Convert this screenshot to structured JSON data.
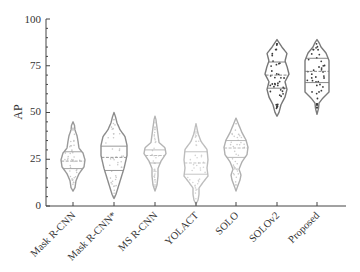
{
  "chart_data": {
    "type": "violin",
    "title": "",
    "xlabel": "",
    "ylabel": "AP",
    "ylim": [
      0,
      100
    ],
    "yticks": [
      0,
      25,
      50,
      75,
      100
    ],
    "grid": false,
    "legend": null,
    "categories": [
      "Mask R-CNN",
      "Mask R-CNN*",
      "MS R-CNN",
      "YOLACT",
      "SOLO",
      "SOLOv2",
      "Proposed"
    ],
    "series": [
      {
        "name": "Mask R-CNN",
        "min": 8,
        "max": 45,
        "q1": 20,
        "median": 24,
        "q3": 29,
        "color": "#9a9a9a",
        "dot_color": "#c8c8c8"
      },
      {
        "name": "Mask R-CNN*",
        "min": 4,
        "max": 50,
        "q1": 19,
        "median": 26,
        "q3": 32,
        "color": "#8c8c8c",
        "dot_color": "#c8c8c8"
      },
      {
        "name": "MS R-CNN",
        "min": 8,
        "max": 48,
        "q1": 23,
        "median": 27,
        "q3": 30,
        "color": "#b4b4b4",
        "dot_color": "#d0d0d0"
      },
      {
        "name": "YOLACT",
        "min": 1,
        "max": 44,
        "q1": 17,
        "median": 23,
        "q3": 29,
        "color": "#bdbdbd",
        "dot_color": "#d4d4d4"
      },
      {
        "name": "SOLO",
        "min": 8,
        "max": 47,
        "q1": 26,
        "median": 31,
        "q3": 35,
        "color": "#b0b0b0",
        "dot_color": "#cccccc"
      },
      {
        "name": "SOLOv2",
        "min": 48,
        "max": 89,
        "q1": 63,
        "median": 70,
        "q3": 77,
        "color": "#777777",
        "dot_color": "#3a3a3a"
      },
      {
        "name": "Proposed",
        "min": 49,
        "max": 89,
        "q1": 66,
        "median": 72,
        "q3": 79,
        "color": "#7a7a7a",
        "dot_color": "#3a3a3a"
      }
    ]
  },
  "labels": {
    "ylabel": "AP",
    "yticks": [
      "0",
      "25",
      "50",
      "75",
      "100"
    ],
    "categories": [
      "Mask R-CNN",
      "Mask R-CNN*",
      "MS R-CNN",
      "YOLACT",
      "SOLO",
      "SOLOv2",
      "Proposed"
    ]
  }
}
